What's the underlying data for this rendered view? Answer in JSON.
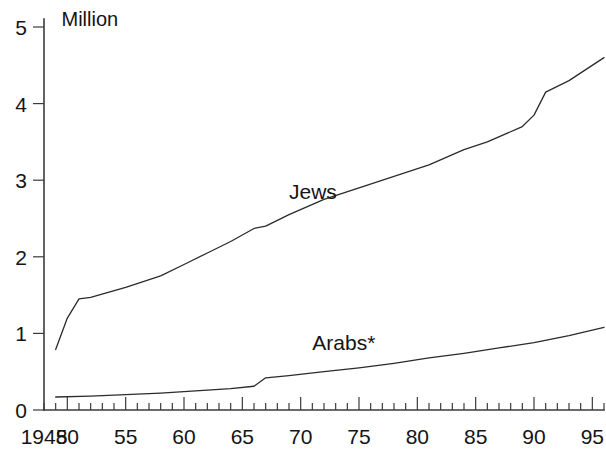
{
  "chart": {
    "unit_label": "Million",
    "y_ticks": [
      "0",
      "1",
      "2",
      "3",
      "4",
      "5"
    ],
    "x_ticks": [
      "1948",
      "50",
      "55",
      "60",
      "65",
      "70",
      "75",
      "80",
      "85",
      "90",
      "95"
    ],
    "series_labels": {
      "jews": "Jews",
      "arabs": "Arabs*"
    },
    "colors": {
      "line": "#2b2b2b",
      "axis": "#3b3b3b",
      "background": "#ffffff",
      "text": "#141414"
    }
  },
  "chart_data": {
    "type": "line",
    "title": "",
    "subtitle": "",
    "xlabel": "",
    "ylabel": "Million",
    "xlim": [
      1948,
      1996
    ],
    "ylim": [
      0,
      5
    ],
    "grid": false,
    "legend_position": "inline-annotation",
    "x_tick_values": [
      1948,
      1950,
      1955,
      1960,
      1965,
      1970,
      1975,
      1980,
      1985,
      1990,
      1995
    ],
    "x_tick_labels": [
      "1948",
      "50",
      "55",
      "60",
      "65",
      "70",
      "75",
      "80",
      "85",
      "90",
      "95"
    ],
    "y_tick_values": [
      0,
      1,
      2,
      3,
      4,
      5
    ],
    "y_tick_labels": [
      "0",
      "1",
      "2",
      "3",
      "4",
      "5"
    ],
    "minor_x_ticks_every": 1,
    "annotations": [
      {
        "text": "Jews",
        "x": 1969,
        "y": 2.75
      },
      {
        "text": "Arabs*",
        "x": 1971,
        "y": 0.78
      },
      {
        "text": "Million",
        "x": 1949.5,
        "y": 5.02
      }
    ],
    "footnote": "*",
    "series": [
      {
        "name": "Jews",
        "x": [
          1949,
          1950,
          1951,
          1952,
          1955,
          1958,
          1960,
          1962,
          1964,
          1966,
          1967,
          1969,
          1972,
          1975,
          1978,
          1981,
          1984,
          1986,
          1989,
          1990,
          1991,
          1993,
          1996
        ],
        "values": [
          0.79,
          1.2,
          1.45,
          1.47,
          1.6,
          1.75,
          1.9,
          2.05,
          2.2,
          2.37,
          2.4,
          2.55,
          2.75,
          2.9,
          3.05,
          3.2,
          3.4,
          3.5,
          3.7,
          3.85,
          4.15,
          4.3,
          4.6
        ]
      },
      {
        "name": "Arabs*",
        "x": [
          1949,
          1952,
          1955,
          1958,
          1961,
          1964,
          1966,
          1967,
          1969,
          1972,
          1975,
          1978,
          1981,
          1984,
          1987,
          1990,
          1993,
          1996
        ],
        "values": [
          0.17,
          0.18,
          0.2,
          0.22,
          0.25,
          0.28,
          0.31,
          0.42,
          0.45,
          0.5,
          0.55,
          0.61,
          0.68,
          0.74,
          0.81,
          0.88,
          0.97,
          1.08
        ]
      }
    ]
  }
}
